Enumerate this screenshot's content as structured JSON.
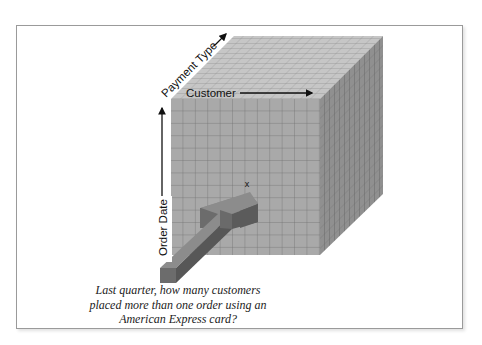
{
  "figure": {
    "type": "data-cube-diagram",
    "axes": {
      "x_label": "Customer",
      "y_label": "Order Date",
      "z_label": "Payment Type"
    },
    "point_marker": "x",
    "caption_lines": [
      "Last quarter, how many customers",
      "placed more than one order using an",
      "American Express card?"
    ],
    "colors": {
      "front_face": "#a8a8a8",
      "top_face": "#c4c4c4",
      "side_face": "#8e8e8e",
      "grid_line": "#6e6e6e",
      "arrow_top": "#8a8a8a",
      "arrow_side": "#5e5e5e",
      "arrow_front": "#6e6e6e",
      "frame_border": "#9a9a9a"
    }
  }
}
